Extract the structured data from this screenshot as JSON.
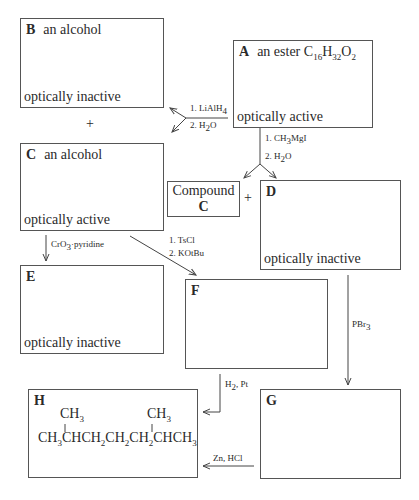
{
  "boxes": {
    "A": {
      "letter": "A",
      "desc": "an ester",
      "formula": {
        "c": "C",
        "cn": "16",
        "h": "H",
        "hn": "32",
        "o": "O",
        "on": "2"
      },
      "note": "optically active"
    },
    "B": {
      "letter": "B",
      "desc": "an alcohol",
      "note": "optically inactive"
    },
    "C": {
      "letter": "C",
      "desc": "an alcohol",
      "note": "optically active"
    },
    "compound_c": {
      "line1": "Compound",
      "line2": "C"
    },
    "D": {
      "letter": "D",
      "note": "optically inactive"
    },
    "E": {
      "letter": "E",
      "note": "optically inactive"
    },
    "F": {
      "letter": "F"
    },
    "G": {
      "letter": "G"
    },
    "H": {
      "letter": "H",
      "branch": "CH",
      "branch_sub": "3",
      "chain": [
        "CH",
        "3",
        "CHCH",
        "2",
        "CH",
        "2",
        "CH",
        "2",
        "CHCH",
        "3"
      ]
    }
  },
  "reagents": {
    "lialh4": {
      "step1": "1. LiAlH",
      "step1_sub": "4",
      "step2": "2. H",
      "step2_sub": "2",
      "step2_end": "O"
    },
    "grignard": {
      "step1": "1. CH",
      "step1_sub": "3",
      "step1_end": "MgI",
      "step2": "2. H",
      "step2_sub": "2",
      "step2_end": "O"
    },
    "oxidation": {
      "text": "CrO",
      "sub": "3",
      "end": "·pyridine"
    },
    "elimination": {
      "step1": "1. TsCl",
      "step2": "2. KOtBu"
    },
    "pbr3": {
      "text": "PBr",
      "sub": "3"
    },
    "hydrogenation": {
      "text": "H",
      "sub": "2",
      "end": ", Pt"
    },
    "reduction": {
      "text": "Zn, HCl"
    }
  },
  "symbols": {
    "plus": "+"
  }
}
